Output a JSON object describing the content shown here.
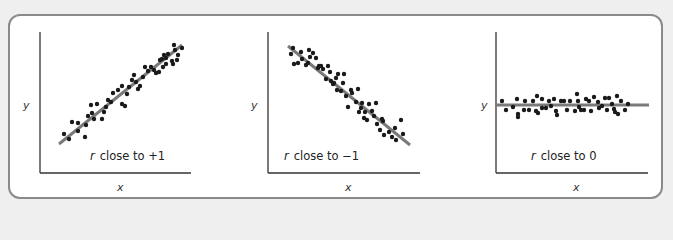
{
  "colors": {
    "background": "#efefef",
    "frame_border": "#8a8a8a",
    "panel_bg": "#ffffff",
    "axis": "#333333",
    "fit_line": "#7a7a7a",
    "points": "#1a1a1a"
  },
  "panels": [
    {
      "caption_symbol": "r",
      "caption_text": "close to +1",
      "xlabel": "x",
      "ylabel": "y"
    },
    {
      "caption_symbol": "r",
      "caption_text": "close to −1",
      "xlabel": "x",
      "ylabel": "y"
    },
    {
      "caption_symbol": "r",
      "caption_text": "close to 0",
      "xlabel": "x",
      "ylabel": "y"
    }
  ],
  "chart_data": [
    {
      "type": "scatter",
      "title": "r close to +1",
      "xlabel": "x",
      "ylabel": "y",
      "description": "Strong positive linear correlation; points tightly scattered around an upward-sloping fit line",
      "fit_line": {
        "slope_sign": "positive"
      },
      "points_px": [
        [
          64,
          134
        ],
        [
          72,
          122
        ],
        [
          69,
          139
        ],
        [
          78,
          131
        ],
        [
          78,
          123
        ],
        [
          86,
          125
        ],
        [
          85,
          137
        ],
        [
          88,
          116
        ],
        [
          92,
          113
        ],
        [
          91,
          105
        ],
        [
          97,
          104
        ],
        [
          94,
          119
        ],
        [
          104,
          112
        ],
        [
          102,
          119
        ],
        [
          106,
          107
        ],
        [
          108,
          100
        ],
        [
          111,
          102
        ],
        [
          113,
          93
        ],
        [
          118,
          90
        ],
        [
          122,
          86
        ],
        [
          122,
          104
        ],
        [
          125,
          106
        ],
        [
          127,
          94
        ],
        [
          132,
          80
        ],
        [
          129,
          87
        ],
        [
          134,
          75
        ],
        [
          136,
          82
        ],
        [
          140,
          86
        ],
        [
          138,
          89
        ],
        [
          145,
          67
        ],
        [
          143,
          77
        ],
        [
          151,
          67
        ],
        [
          148,
          71
        ],
        [
          156,
          73
        ],
        [
          154,
          70
        ],
        [
          163,
          67
        ],
        [
          159,
          72
        ],
        [
          162,
          59
        ],
        [
          166,
          58
        ],
        [
          166,
          64
        ],
        [
          168,
          54
        ],
        [
          173,
          64
        ],
        [
          175,
          50
        ],
        [
          174,
          45
        ],
        [
          178,
          55
        ],
        [
          172,
          61
        ],
        [
          177,
          60
        ],
        [
          182,
          48
        ],
        [
          164,
          55
        ],
        [
          160,
          60
        ]
      ]
    },
    {
      "type": "scatter",
      "title": "r close to −1",
      "xlabel": "x",
      "ylabel": "y",
      "description": "Strong negative linear correlation; points tightly scattered around a downward-sloping fit line",
      "fit_line": {
        "slope_sign": "negative"
      },
      "points_px": [
        [
          291,
          54
        ],
        [
          293,
          48
        ],
        [
          294,
          64
        ],
        [
          298,
          63
        ],
        [
          301,
          52
        ],
        [
          302,
          59
        ],
        [
          306,
          65
        ],
        [
          308,
          63
        ],
        [
          310,
          57
        ],
        [
          309,
          50
        ],
        [
          313,
          53
        ],
        [
          316,
          58
        ],
        [
          318,
          68
        ],
        [
          319,
          66
        ],
        [
          321,
          66
        ],
        [
          323,
          69
        ],
        [
          326,
          79
        ],
        [
          328,
          66
        ],
        [
          330,
          72
        ],
        [
          331,
          81
        ],
        [
          333,
          84
        ],
        [
          334,
          83
        ],
        [
          336,
          78
        ],
        [
          337,
          90
        ],
        [
          338,
          74
        ],
        [
          341,
          91
        ],
        [
          343,
          83
        ],
        [
          344,
          74
        ],
        [
          346,
          96
        ],
        [
          348,
          107
        ],
        [
          351,
          90
        ],
        [
          352,
          93
        ],
        [
          356,
          102
        ],
        [
          358,
          89
        ],
        [
          359,
          112
        ],
        [
          361,
          108
        ],
        [
          362,
          103
        ],
        [
          364,
          118
        ],
        [
          365,
          112
        ],
        [
          367,
          120
        ],
        [
          369,
          104
        ],
        [
          372,
          111
        ],
        [
          374,
          116
        ],
        [
          377,
          124
        ],
        [
          380,
          130
        ],
        [
          382,
          119
        ],
        [
          384,
          135
        ],
        [
          389,
          132
        ],
        [
          392,
          137
        ],
        [
          395,
          128
        ],
        [
          396,
          140
        ],
        [
          403,
          134
        ],
        [
          401,
          120
        ],
        [
          383,
          121
        ],
        [
          376,
          103
        ]
      ]
    },
    {
      "type": "scatter",
      "title": "r close to 0",
      "xlabel": "x",
      "ylabel": "y",
      "description": "No linear correlation; points scattered around a horizontal fit line",
      "fit_line": {
        "slope_sign": "zero"
      },
      "points_px": [
        [
          502,
          101
        ],
        [
          506,
          110
        ],
        [
          513,
          107
        ],
        [
          517,
          99
        ],
        [
          518,
          114
        ],
        [
          518,
          117
        ],
        [
          524,
          110
        ],
        [
          525,
          101
        ],
        [
          529,
          110
        ],
        [
          533,
          101
        ],
        [
          536,
          111
        ],
        [
          537,
          96
        ],
        [
          538,
          113
        ],
        [
          542,
          108
        ],
        [
          542,
          99
        ],
        [
          546,
          108
        ],
        [
          549,
          101
        ],
        [
          551,
          106
        ],
        [
          554,
          99
        ],
        [
          556,
          111
        ],
        [
          557,
          115
        ],
        [
          561,
          101
        ],
        [
          564,
          101
        ],
        [
          567,
          110
        ],
        [
          570,
          101
        ],
        [
          575,
          111
        ],
        [
          577,
          94
        ],
        [
          578,
          101
        ],
        [
          579,
          107
        ],
        [
          581,
          110
        ],
        [
          584,
          110
        ],
        [
          586,
          99
        ],
        [
          589,
          101
        ],
        [
          591,
          111
        ],
        [
          594,
          97
        ],
        [
          598,
          102
        ],
        [
          599,
          108
        ],
        [
          602,
          106
        ],
        [
          605,
          98
        ],
        [
          607,
          110
        ],
        [
          609,
          98
        ],
        [
          612,
          104
        ],
        [
          614,
          109
        ],
        [
          615,
          112
        ],
        [
          617,
          96
        ],
        [
          618,
          114
        ],
        [
          621,
          101
        ],
        [
          625,
          110
        ],
        [
          628,
          104
        ]
      ]
    }
  ]
}
